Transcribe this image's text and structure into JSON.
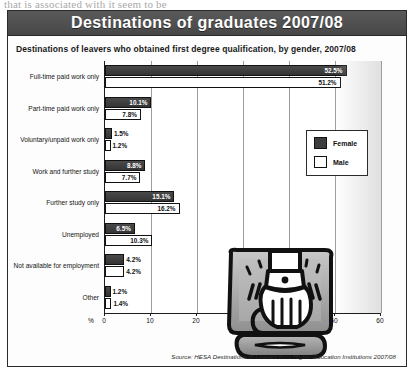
{
  "page": {
    "bleed_text": "that is associated with it seem to be"
  },
  "figure": {
    "title": "Destinations of graduates 2007/08",
    "subtitle": "Destinations of leavers who obtained first degree qualification, by gender, 2007/08",
    "source": "Source: HESA Destinations of Leavers from Higher Education Institutions 2007/08"
  },
  "legend": {
    "position": "top-right",
    "items": [
      {
        "label": "Female",
        "color": "#3d3d3d"
      },
      {
        "label": "Male",
        "color": "#ffffff"
      }
    ]
  },
  "axis": {
    "unit": "%",
    "ticks": [
      "0",
      "10",
      "20",
      "30",
      "40",
      "50",
      "60"
    ]
  },
  "illustration": {
    "name": "hand-reaching-out-of-monitor-illustration"
  },
  "chart_data": {
    "type": "bar",
    "orientation": "horizontal",
    "title": "Destinations of graduates 2007/08",
    "subtitle": "Destinations of leavers who obtained first degree qualification, by gender, 2007/08",
    "xlabel": "%",
    "ylabel": "",
    "xlim": [
      0,
      60
    ],
    "grid": true,
    "legend_position": "top-right",
    "categories": [
      "Full-time paid work only",
      "Part-time paid work only",
      "Voluntary/unpaid work only",
      "Work and further study",
      "Further study only",
      "Unemployed",
      "Not available for employment",
      "Other"
    ],
    "series": [
      {
        "name": "Female",
        "color": "#3d3d3d",
        "values": [
          52.5,
          10.1,
          1.5,
          8.8,
          15.1,
          6.5,
          4.2,
          1.2
        ],
        "labels": [
          "52.5%",
          "10.1%",
          "1.5%",
          "8.8%",
          "15.1%",
          "6.5%",
          "4.2%",
          "1.2%"
        ]
      },
      {
        "name": "Male",
        "color": "#ffffff",
        "values": [
          51.2,
          7.8,
          1.2,
          7.7,
          16.2,
          10.3,
          4.2,
          1.4
        ],
        "labels": [
          "51.2%",
          "7.8%",
          "1.2%",
          "7.7%",
          "16.2%",
          "10.3%",
          "4.2%",
          "1.4%"
        ]
      }
    ],
    "source": "Source: HESA Destinations of Leavers from Higher Education Institutions 2007/08"
  }
}
